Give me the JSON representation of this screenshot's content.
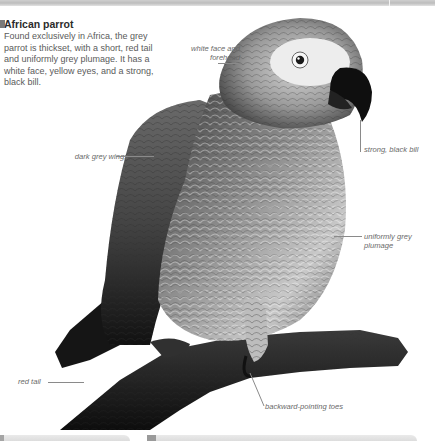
{
  "intro": {
    "title": "African parrot",
    "body": "Found exclusively in Africa, the grey parrot is thickset, with a short, red tail and uniformly grey plumage. It has a white face, yellow eyes, and a strong, black bill."
  },
  "image": {
    "subject": "African grey parrot perched on a branch",
    "icon": "parrot-photo"
  },
  "annotations": [
    {
      "id": "face",
      "text": "white face and forehead"
    },
    {
      "id": "bill",
      "text": "strong, black bill"
    },
    {
      "id": "wings",
      "text": "dark grey wings"
    },
    {
      "id": "plumage",
      "text": "uniformly grey plumage"
    },
    {
      "id": "tail",
      "text": "red tail"
    },
    {
      "id": "toes",
      "text": "backward-pointing toes"
    }
  ],
  "colors": {
    "background": "#ffffff",
    "title": "#2b2b2b",
    "body_text": "#5a5a5a",
    "label_text": "#6a6a6a",
    "rule": "#c4c4c4"
  }
}
